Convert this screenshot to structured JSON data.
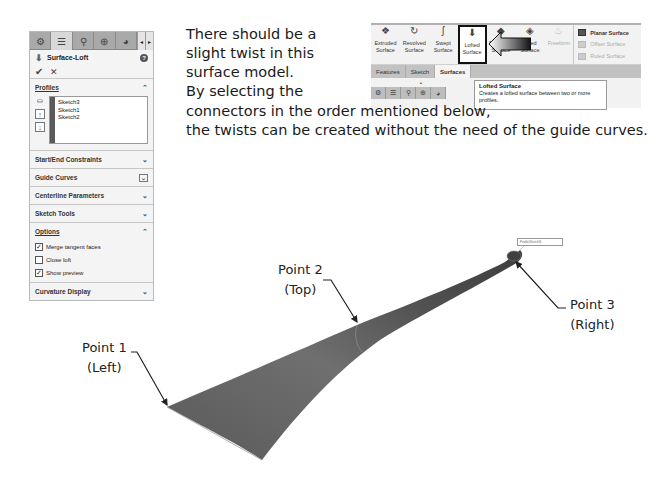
{
  "property_manager": {
    "tabs": [
      {
        "icon": "feature-manager-icon",
        "glyph": "⚙"
      },
      {
        "icon": "property-manager-icon",
        "glyph": "☰"
      },
      {
        "icon": "configuration-manager-icon",
        "glyph": "⚲"
      },
      {
        "icon": "dimxpert-icon",
        "glyph": "⊕"
      },
      {
        "icon": "display-manager-icon",
        "glyph": "◕"
      }
    ],
    "scroll_left": "◂",
    "scroll_right": "▸",
    "title": "Surface-Loft",
    "help_glyph": "?",
    "ok_glyph": "✔",
    "cancel_glyph": "✕",
    "sections": {
      "profiles": {
        "label": "Profiles",
        "chevron": "⌃",
        "items": [
          "Sketch3",
          "Sketch1",
          "Sketch2"
        ],
        "move_up": "↑",
        "move_down": "↓"
      },
      "start_end_constraints": {
        "label": "Start/End Constraints",
        "chevron": "⌄"
      },
      "guide_curves": {
        "label": "Guide Curves",
        "chevron": "⌄"
      },
      "centerline_parameters": {
        "label": "Centerline Parameters",
        "chevron": "⌄"
      },
      "sketch_tools": {
        "label": "Sketch Tools",
        "chevron": "⌄"
      },
      "options": {
        "label": "Options",
        "chevron": "⌃",
        "checkboxes": [
          {
            "label": "Merge tangent faces",
            "checked": true
          },
          {
            "label": "Close loft",
            "checked": false
          },
          {
            "label": "Show preview",
            "checked": true
          }
        ]
      },
      "curvature_display": {
        "label": "Curvature Display",
        "chevron": "⌄"
      }
    }
  },
  "ribbon": {
    "buttons": [
      {
        "label": "Extruded Surface",
        "glyph": "❖"
      },
      {
        "label": "Revolved Surface",
        "glyph": "↻"
      },
      {
        "label": "Swept Surface",
        "glyph": "ʃ"
      },
      {
        "label": "Lofted Surface",
        "glyph": "⬇"
      },
      {
        "label": "Boundary Surface",
        "glyph": "◆"
      },
      {
        "label": "Filled Surface",
        "glyph": "◈"
      },
      {
        "label": "Freeform",
        "glyph": "♨"
      }
    ],
    "right_items": [
      {
        "label": "Planar Surface",
        "enabled": true
      },
      {
        "label": "Offset Surface",
        "enabled": false
      },
      {
        "label": "Ruled Surface",
        "enabled": false
      }
    ],
    "tabs": [
      "Features",
      "Sketch",
      "Surfaces"
    ],
    "active_tab": "Surfaces",
    "tooltip": {
      "title": "Lofted Surface",
      "description": "Creates a lofted surface between two or more profiles."
    },
    "bottom_tab_glyphs": [
      "⚙",
      "☰",
      "⚲",
      "⊕",
      "◕"
    ]
  },
  "instructions": {
    "line1": "There should be a",
    "line2": "slight twist in this",
    "line3": "surface model.",
    "line4": "By selecting the",
    "line5": "connectors in the order mentioned below,",
    "line6": "the twists can be created without the need of the guide curves."
  },
  "callouts": {
    "point1": {
      "title": "Point 1",
      "sub": "(Left)"
    },
    "point2": {
      "title": "Point 2",
      "sub": "(Top)"
    },
    "point3": {
      "title": "Point 3",
      "sub": "(Right)"
    }
  },
  "model_tag": "Profile(Sketch3)",
  "colors": {
    "surface_dark": "#4a4a4a",
    "surface_mid": "#6e6e6e",
    "surface_light": "#8a8a8a",
    "panel_bg": "#f4f4f4",
    "tab_bar": "#a9a9a9"
  }
}
